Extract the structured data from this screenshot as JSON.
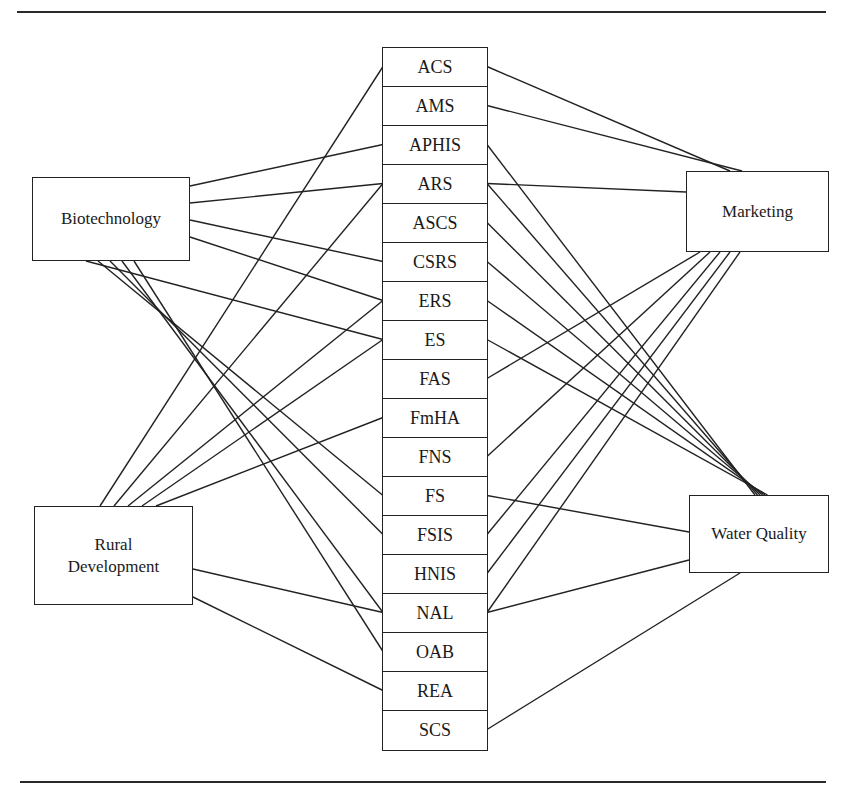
{
  "diagram": {
    "type": "bipartite-network",
    "topics": {
      "biotechnology": {
        "label": "Biotechnology"
      },
      "rural_development": {
        "label": "Rural\nDevelopment"
      },
      "marketing": {
        "label": "Marketing"
      },
      "water_quality": {
        "label": "Water Quality"
      }
    },
    "agencies": [
      {
        "id": "ACS",
        "label": "ACS"
      },
      {
        "id": "AMS",
        "label": "AMS"
      },
      {
        "id": "APHIS",
        "label": "APHIS"
      },
      {
        "id": "ARS",
        "label": "ARS"
      },
      {
        "id": "ASCS",
        "label": "ASCS"
      },
      {
        "id": "CSRS",
        "label": "CSRS"
      },
      {
        "id": "ERS",
        "label": "ERS"
      },
      {
        "id": "ES",
        "label": "ES"
      },
      {
        "id": "FAS",
        "label": "FAS"
      },
      {
        "id": "FmHA",
        "label": "FmHA"
      },
      {
        "id": "FNS",
        "label": "FNS"
      },
      {
        "id": "FS",
        "label": "FS"
      },
      {
        "id": "FSIS",
        "label": "FSIS"
      },
      {
        "id": "HNIS",
        "label": "HNIS"
      },
      {
        "id": "NAL",
        "label": "NAL"
      },
      {
        "id": "OAB",
        "label": "OAB"
      },
      {
        "id": "REA",
        "label": "REA"
      },
      {
        "id": "SCS",
        "label": "SCS"
      }
    ],
    "links": {
      "biotechnology": [
        "APHIS",
        "ARS",
        "CSRS",
        "ERS",
        "ES",
        "FS",
        "FSIS",
        "NAL",
        "OAB"
      ],
      "rural_development": [
        "ACS",
        "ARS",
        "ERS",
        "ES",
        "FmHA",
        "NAL",
        "REA"
      ],
      "marketing": [
        "ACS",
        "AMS",
        "ARS",
        "FAS",
        "FNS",
        "FSIS",
        "HNIS",
        "NAL"
      ],
      "water_quality": [
        "APHIS",
        "ARS",
        "ASCS",
        "CSRS",
        "ERS",
        "ES",
        "FS",
        "NAL",
        "SCS"
      ]
    }
  }
}
